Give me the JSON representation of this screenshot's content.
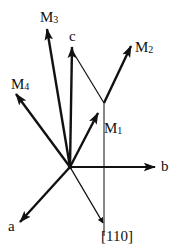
{
  "diagram": {
    "origin": [
      70,
      167
    ],
    "colors": {
      "ink": "#111111",
      "background": "#ffffff"
    },
    "labels": {
      "M3": {
        "main": "M",
        "sub": "3"
      },
      "c": "c",
      "M2": {
        "main": "M",
        "sub": "2"
      },
      "M4": {
        "main": "M",
        "sub": "4"
      },
      "M1": {
        "main": "M",
        "sub": "1"
      },
      "b": "b",
      "a": "a",
      "dir110": "[110]"
    }
  }
}
